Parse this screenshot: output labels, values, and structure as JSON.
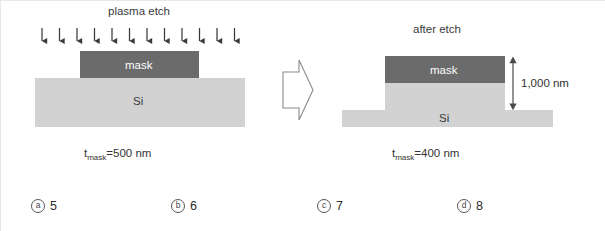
{
  "figure": {
    "left_panel": {
      "title": "plasma etch",
      "mask_label": "mask",
      "substrate_label": "Si",
      "caption_prefix": "t",
      "caption_subscript": "mask",
      "caption_value": "=500 nm",
      "arrow_count": 12,
      "arrow_icon": "down-arrow-icon"
    },
    "transition": {
      "icon": "right-block-arrow-icon"
    },
    "right_panel": {
      "title": "after etch",
      "mask_label": "mask",
      "substrate_label": "Si",
      "dimension_label": "1,000 nm",
      "dimension_icon": "double-headed-vertical-arrow-icon",
      "caption_prefix": "t",
      "caption_subscript": "mask",
      "caption_value": "=400 nm"
    },
    "colors": {
      "mask_fill": "#6b6b6b",
      "silicon_fill": "#d2d2d2",
      "arrow_stroke": "#3a3a3a",
      "outline_stroke": "#7a7a7a",
      "background": "#ffffff"
    },
    "options": [
      {
        "marker": "a",
        "value": "5"
      },
      {
        "marker": "b",
        "value": "6"
      },
      {
        "marker": "c",
        "value": "7"
      },
      {
        "marker": "d",
        "value": "8"
      }
    ]
  }
}
